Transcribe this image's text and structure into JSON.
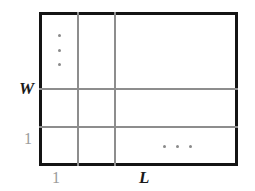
{
  "diagram": {
    "name": "grid-partition-diagram",
    "background_color": "#ffffff",
    "border_color": "#141414",
    "divider_color": "#8d8d8d",
    "dot_color": "#8a8a8a",
    "labels": {
      "width_label": "W",
      "width_unit_label": "1",
      "length_label": "L",
      "length_unit_label": "1"
    },
    "ellipsis": {
      "vertical": "⋮",
      "horizontal": "⋯",
      "vertical_dot_count": 3,
      "horizontal_dot_count": 3
    },
    "grid": {
      "columns": 3,
      "rows": 3,
      "column_dividers_x": [
        77,
        114
      ],
      "row_dividers_y": [
        88,
        126
      ]
    }
  }
}
